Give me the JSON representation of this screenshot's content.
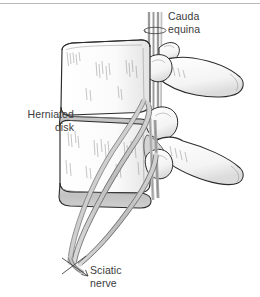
{
  "figure": {
    "background_color": "#ffffff",
    "border_color": "#b9b9b9"
  },
  "labels": {
    "cauda_equina": "Cauda\nequina",
    "herniated_disk": "Herniated\ndisk",
    "sciatic_nerve": "Sciatic\nnerve"
  },
  "colors": {
    "outline": "#2b2b2b",
    "bone_fill": "#fbfbfb",
    "bone_shade": "#e6e6e6",
    "disk_fill": "#c9c9c9",
    "disk_outline": "#3a3a3a",
    "nerve_fill": "#c4c4c4",
    "nerve_outline": "#555555",
    "hatch": "#6d6d6d",
    "text": "#3b3b3b"
  },
  "structures": [
    {
      "name": "upper-vertebral-body",
      "kind": "bone"
    },
    {
      "name": "lower-vertebral-body",
      "kind": "bone"
    },
    {
      "name": "herniated-disk",
      "kind": "disk"
    },
    {
      "name": "lower-disk",
      "kind": "disk"
    },
    {
      "name": "upper-spinous-process",
      "kind": "bone"
    },
    {
      "name": "lower-spinous-process",
      "kind": "bone"
    },
    {
      "name": "superior-articular-process",
      "kind": "bone"
    },
    {
      "name": "inferior-articular-process",
      "kind": "bone"
    },
    {
      "name": "cauda-equina",
      "kind": "nerve"
    },
    {
      "name": "nerve-root-anterior",
      "kind": "nerve"
    },
    {
      "name": "nerve-root-posterior",
      "kind": "nerve"
    },
    {
      "name": "sciatic-nerve",
      "kind": "nerve"
    }
  ],
  "markers": {
    "cauda_cut_mark": "ellipse-cut",
    "sciatic_cut_mark": "x-cut-arrow"
  }
}
